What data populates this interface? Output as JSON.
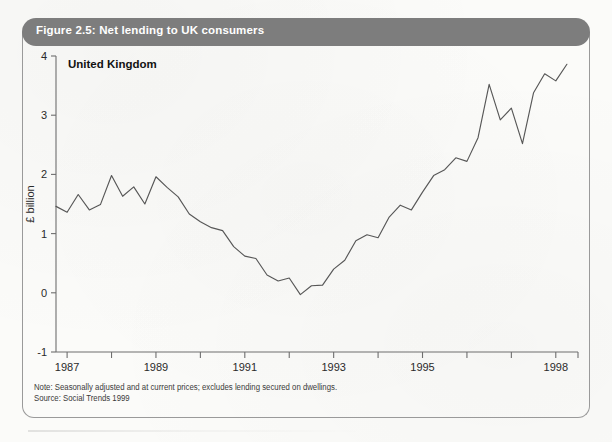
{
  "figure": {
    "title": "Figure 2.5: Net lending to UK consumers",
    "title_bar_color": "#7d7d7d",
    "title_text_color": "#ffffff",
    "border_color": "#9a9a9a",
    "background_color": "#fbfbf9"
  },
  "notes": {
    "note": "Note: Seasonally adjusted and at current prices; excludes lending secured on dwellings.",
    "source": "Source: Social Trends 1999"
  },
  "chart_data": {
    "type": "line",
    "title": "Net lending to UK consumers",
    "xlabel": "",
    "ylabel": "£ billion",
    "series_label": "United Kingdom",
    "line_color": "#575757",
    "grid": false,
    "legend": "inline-annotation",
    "ylim": [
      -1,
      4
    ],
    "ytick_labels": [
      "4",
      "3",
      "2",
      "1",
      "0",
      "-1"
    ],
    "ytick_values": [
      4,
      3,
      2,
      1,
      0,
      -1
    ],
    "xlim": [
      1986.75,
      1998.5
    ],
    "xtick_values": [
      1987,
      1988,
      1989,
      1990,
      1991,
      1992,
      1993,
      1994,
      1995,
      1996,
      1997,
      1998
    ],
    "xtick_labels": [
      "1987",
      "",
      "1989",
      "",
      "1991",
      "",
      "1993",
      "",
      "1995",
      "",
      "",
      "1998"
    ],
    "x_label_shown": [
      "1987",
      "1989",
      "1991",
      "1993",
      "1995",
      "1998"
    ],
    "x": [
      1986.75,
      1987.0,
      1987.25,
      1987.5,
      1987.75,
      1988.0,
      1988.25,
      1988.5,
      1988.75,
      1989.0,
      1989.25,
      1989.5,
      1989.75,
      1990.0,
      1990.25,
      1990.5,
      1990.75,
      1991.0,
      1991.25,
      1991.5,
      1991.75,
      1992.0,
      1992.25,
      1992.5,
      1992.75,
      1993.0,
      1993.25,
      1993.5,
      1993.75,
      1994.0,
      1994.25,
      1994.5,
      1994.75,
      1995.0,
      1995.25,
      1995.5,
      1995.75,
      1996.0,
      1996.25,
      1996.5,
      1996.75,
      1997.0,
      1997.25,
      1997.5,
      1997.75,
      1998.0,
      1998.25
    ],
    "values": [
      1.46,
      1.36,
      1.66,
      1.4,
      1.49,
      1.98,
      1.63,
      1.79,
      1.5,
      1.96,
      1.78,
      1.62,
      1.33,
      1.2,
      1.1,
      1.05,
      0.78,
      0.62,
      0.58,
      0.3,
      0.2,
      0.25,
      -0.03,
      0.12,
      0.13,
      0.4,
      0.55,
      0.88,
      0.98,
      0.93,
      1.28,
      1.48,
      1.4,
      1.7,
      1.98,
      2.08,
      2.28,
      2.22,
      2.62,
      3.52,
      2.92,
      3.12,
      2.52,
      3.38,
      3.7,
      3.58,
      3.86
    ],
    "units": "£ billion",
    "frequency": "quarterly"
  },
  "a11y": {
    "chart_role": "line chart",
    "plot_name": "net-lending-line-chart"
  }
}
